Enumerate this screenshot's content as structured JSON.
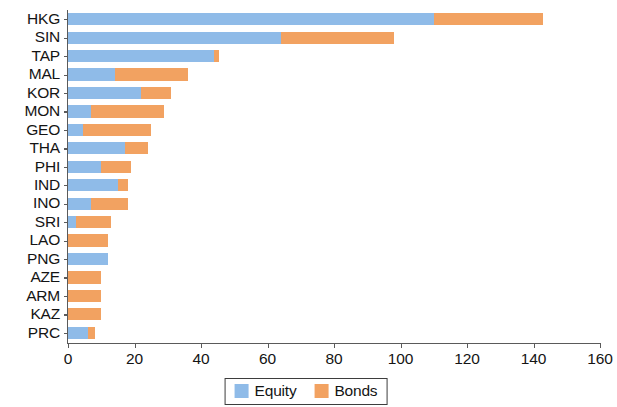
{
  "title_remnant": "Portfolio Investment Liabilities (% of GDP)",
  "colors": {
    "equity": "#8fbbe8",
    "bonds": "#f2a261",
    "axis": "#5a5a5a",
    "text": "#141414",
    "background": "#ffffff"
  },
  "legend": {
    "items": [
      {
        "label": "Equity",
        "color": "#8fbbe8"
      },
      {
        "label": "Bonds",
        "color": "#f2a261"
      }
    ]
  },
  "chart_data": {
    "type": "bar",
    "orientation": "horizontal",
    "stacked": true,
    "title": "",
    "xlabel": "",
    "ylabel": "",
    "xlim": [
      0,
      160
    ],
    "xticks": [
      0,
      20,
      40,
      60,
      80,
      100,
      120,
      140,
      160
    ],
    "xtick_labels": [
      "0",
      "20",
      "40",
      "60",
      "80",
      "100",
      "120",
      "140",
      "160"
    ],
    "grid": false,
    "legend_position": "bottom-center",
    "categories": [
      "HKG",
      "SIN",
      "TAP",
      "MAL",
      "KOR",
      "MON",
      "GEO",
      "THA",
      "PHI",
      "IND",
      "INO",
      "SRI",
      "LAO",
      "PNG",
      "AZE",
      "ARM",
      "KAZ",
      "PRC"
    ],
    "series": [
      {
        "name": "Equity",
        "color": "#8fbbe8",
        "values": [
          110,
          64,
          44,
          14,
          22,
          7,
          4.5,
          17,
          10,
          15,
          7,
          2.5,
          0,
          12,
          0,
          0,
          0,
          6
        ]
      },
      {
        "name": "Bonds",
        "color": "#f2a261",
        "values": [
          33,
          34,
          1.5,
          22,
          9,
          22,
          20.5,
          7,
          9,
          3,
          11,
          10.5,
          12,
          0,
          10,
          10,
          10,
          2
        ]
      }
    ],
    "totals": [
      143,
      98,
      45.5,
      36,
      31,
      29,
      25,
      24,
      19,
      18,
      18,
      13,
      12,
      12,
      10,
      10,
      10,
      8
    ]
  }
}
